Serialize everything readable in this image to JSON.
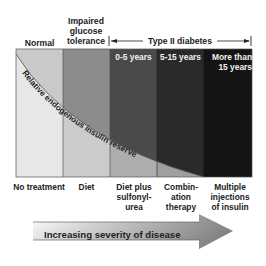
{
  "stages": [
    {
      "label": "Normal",
      "color": "#c9c9c9"
    },
    {
      "label": "Impaired glucose tolerance",
      "color": "#8c8c8c"
    },
    {
      "label": "0-5 years",
      "color": "#4a4a4a"
    },
    {
      "label": "5-15 years",
      "color": "#2a2a2a"
    },
    {
      "label": "More than 15 years",
      "color": "#141414"
    }
  ],
  "header": {
    "normal": "Normal",
    "igt_line1": "Impaired",
    "igt_line2": "glucose",
    "igt_line3": "tolerance",
    "type2": "Type II diabetes"
  },
  "inner_labels": {
    "c3": "0-5 years",
    "c4": "5-15 years",
    "c5_line1": "More than",
    "c5_line2": "15 years"
  },
  "curve_label": "Relative endogenous insulin reserve",
  "treatments": [
    {
      "lines": [
        "No treatment"
      ]
    },
    {
      "lines": [
        "Diet"
      ]
    },
    {
      "lines": [
        "Diet plus",
        "sulfonyl-",
        "urea"
      ]
    },
    {
      "lines": [
        "Combin-",
        "ation",
        "therapy"
      ]
    },
    {
      "lines": [
        "Multiple",
        "injections",
        "of insulin"
      ]
    }
  ],
  "t": {
    "t0": "No treatment",
    "t1": "Diet",
    "t2a": "Diet plus",
    "t2b": "sulfonyl-",
    "t2c": "urea",
    "t3a": "Combin-",
    "t3b": "ation",
    "t3c": "therapy",
    "t4a": "Multiple",
    "t4b": "injections",
    "t4c": "of insulin"
  },
  "arrow_label": "Increasing severity of disease",
  "reserve_fill_color": "#e6e6e6"
}
